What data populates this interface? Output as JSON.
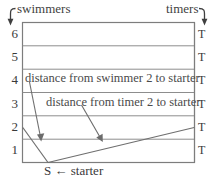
{
  "diagram": {
    "top_left_label": "swimmers",
    "top_right_label": "timers",
    "left_arrow_icon": "hook-arrow-down-icon",
    "right_arrow_icon": "hook-arrow-down-icon",
    "row_labels": [
      "6",
      "5",
      "4",
      "3",
      "2",
      "1"
    ],
    "timer_labels": [
      "T",
      "T",
      "T",
      "T",
      "T",
      "T"
    ],
    "annotations": [
      {
        "text": "distance from swimmer 2 to starter",
        "points_to": "swimmer-2-line"
      },
      {
        "text": "distance from timer 2 to starter",
        "points_to": "timer-2-line"
      }
    ],
    "starter_label": "S ← starter",
    "starter_point_label": "S",
    "colors": {
      "grid": "#8a8a8a",
      "border": "#777777",
      "text": "#3a3a3a",
      "line": "#6f6f6f",
      "arrow": "#6b6b6b",
      "background": "#ffffff"
    }
  }
}
